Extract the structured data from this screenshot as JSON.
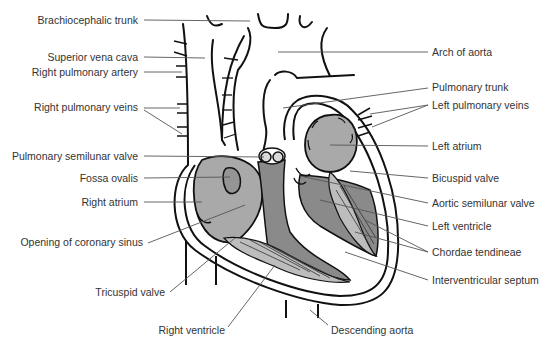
{
  "diagram": {
    "colors": {
      "background": "#ffffff",
      "outline": "#111111",
      "leader_line": "#555555",
      "label_text": "#333333",
      "atrium_fill": "#a9a9a9",
      "ventricle_fill": "#8a8a8a",
      "valve_fill": "#c8c8c8",
      "chordae_fill": "#bdbdbd"
    },
    "labels_left": [
      {
        "text": "Brachiocephalic trunk",
        "x": 137,
        "y": 20
      },
      {
        "text": "Superior vena cava",
        "x": 137,
        "y": 57
      },
      {
        "text": "Right pulmonary artery",
        "x": 137,
        "y": 72
      },
      {
        "text": "Right pulmonary veins",
        "x": 137,
        "y": 107
      },
      {
        "text": "Pulmonary semilunar valve",
        "x": 137,
        "y": 156
      },
      {
        "text": "Fossa ovalis",
        "x": 137,
        "y": 178
      },
      {
        "text": "Right atrium",
        "x": 137,
        "y": 202
      },
      {
        "text": "Opening of coronary sinus",
        "x": 142,
        "y": 242
      },
      {
        "text": "Tricuspid valve",
        "x": 164,
        "y": 292
      },
      {
        "text": "Right ventricle",
        "x": 224,
        "y": 330
      }
    ],
    "labels_right": [
      {
        "text": "Arch of aorta",
        "x": 432,
        "y": 52
      },
      {
        "text": "Pulmonary trunk",
        "x": 432,
        "y": 87
      },
      {
        "text": "Left pulmonary veins",
        "x": 432,
        "y": 105
      },
      {
        "text": "Left atrium",
        "x": 432,
        "y": 146
      },
      {
        "text": "Bicuspid valve",
        "x": 432,
        "y": 178
      },
      {
        "text": "Aortic semilunar valve",
        "x": 432,
        "y": 203
      },
      {
        "text": "Left ventricle",
        "x": 432,
        "y": 226
      },
      {
        "text": "Chordae tendineae",
        "x": 432,
        "y": 252
      },
      {
        "text": "Interventricular septum",
        "x": 432,
        "y": 280
      },
      {
        "text": "Descending aorta",
        "x": 331,
        "y": 330
      }
    ]
  }
}
